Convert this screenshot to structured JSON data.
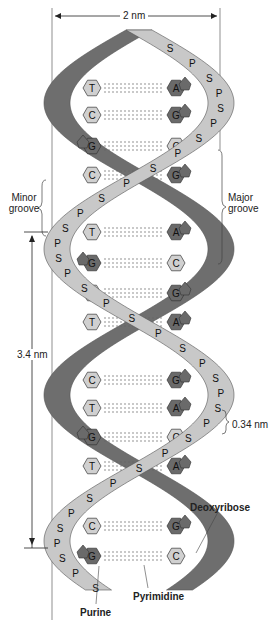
{
  "figure": {
    "width_label": "2 nm",
    "minor_groove_label": [
      "Minor",
      "groove"
    ],
    "major_groove_label": [
      "Major",
      "groove"
    ],
    "pitch_label": "3.4 nm",
    "rise_label": "0.34 nm",
    "deoxyribose_label": "Deoxyribose",
    "pyrimidine_label": "Pyrimidine",
    "purine_label": "Purine",
    "colors": {
      "light_strand": "#c8c8c8",
      "dark_strand": "#6e6e6e",
      "purine_fill": "#6a6a6a",
      "pyrimidine_fill": "#d0d0d0",
      "outline": "#333333"
    },
    "base_pairs": [
      {
        "y": 88,
        "left": "T",
        "right": "A"
      },
      {
        "y": 115,
        "left": "C",
        "right": "G"
      },
      {
        "y": 146,
        "left": "G",
        "right": "C"
      },
      {
        "y": 175,
        "left": "C",
        "right": "G"
      },
      {
        "y": 232,
        "left": "T",
        "right": "A"
      },
      {
        "y": 263,
        "left": "G",
        "right": "C"
      },
      {
        "y": 293,
        "left": "C",
        "right": "G"
      },
      {
        "y": 322,
        "left": "T",
        "right": "A"
      },
      {
        "y": 380,
        "left": "C",
        "right": "G"
      },
      {
        "y": 408,
        "left": "T",
        "right": "A"
      },
      {
        "y": 437,
        "left": "G",
        "right": "C"
      },
      {
        "y": 466,
        "left": "T",
        "right": "A"
      },
      {
        "y": 526,
        "left": "C",
        "right": "G"
      },
      {
        "y": 556,
        "left": "G",
        "right": "C"
      }
    ],
    "backbone_letters": {
      "sugar": "S",
      "phosphate": "P"
    }
  }
}
